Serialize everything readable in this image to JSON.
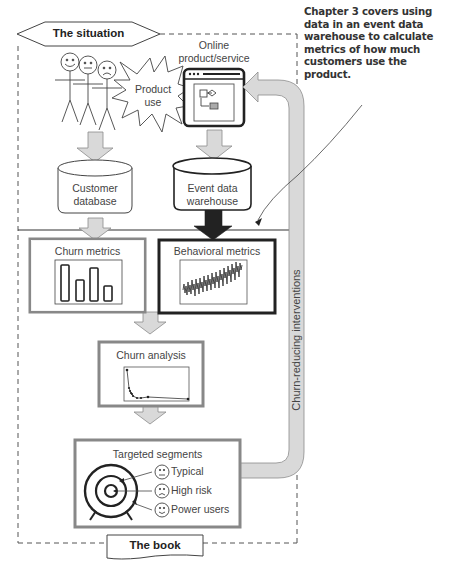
{
  "header": {
    "situation_label": "The situation",
    "book_label": "The book"
  },
  "callout": {
    "text": "Chapter 3 covers using data in an event data warehouse to calculate metrics of how much customers use the product."
  },
  "nodes": {
    "product_use": {
      "line1": "Product",
      "line2": "use"
    },
    "online_product": {
      "line1": "Online",
      "line2": "product/service"
    },
    "customer_db": {
      "line1": "Customer",
      "line2": "database"
    },
    "event_dw": {
      "line1": "Event data",
      "line2": "warehouse"
    },
    "churn_metrics": {
      "title": "Churn metrics"
    },
    "behavioral_metrics": {
      "title": "Behavioral metrics"
    },
    "churn_analysis": {
      "title": "Churn analysis"
    },
    "targeted_segments": {
      "title": "Targeted segments",
      "segments": [
        {
          "label": "Typical",
          "face": "neutral"
        },
        {
          "label": "High risk",
          "face": "sad"
        },
        {
          "label": "Power users",
          "face": "happy"
        }
      ]
    }
  },
  "loop_arrow": {
    "label": "Churn-reducing interventions"
  },
  "colors": {
    "arrow_fill": "#d9d9d9",
    "arrow_stroke": "#8c8c8c",
    "dark": "#222222",
    "box_border": "#888888"
  }
}
